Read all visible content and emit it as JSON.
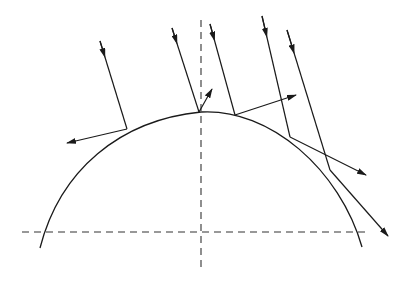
{
  "diagram": {
    "type": "ray-reflection-on-curved-surface",
    "colors": {
      "stroke": "#1a1a1a",
      "background": "#ffffff"
    },
    "axes": {
      "vertical": {
        "x": 201,
        "y1": 20,
        "y2": 268,
        "style": "dashed"
      },
      "horizontal": {
        "y": 232,
        "x1": 22,
        "x2": 370,
        "style": "dashed"
      }
    },
    "surface": {
      "shape": "arc",
      "path": "M40,248 C60,170 120,120 201,112 C270,108 340,170 362,247"
    },
    "rays": [
      {
        "id": 1,
        "incident": [
          [
            100,
            41
          ],
          [
            127,
            129
          ]
        ],
        "reflected": [
          [
            127,
            129
          ],
          [
            67,
            143
          ]
        ]
      },
      {
        "id": 2,
        "incident": [
          [
            172,
            28
          ],
          [
            199,
            112
          ]
        ],
        "reflected": [
          [
            199,
            112
          ],
          [
            212,
            89
          ]
        ]
      },
      {
        "id": 3,
        "incident": [
          [
            210,
            24
          ],
          [
            235,
            115
          ]
        ],
        "reflected": [
          [
            235,
            115
          ],
          [
            296,
            95
          ]
        ]
      },
      {
        "id": 4,
        "incident": [
          [
            262,
            16
          ],
          [
            290,
            137
          ]
        ],
        "reflected": [
          [
            290,
            137
          ],
          [
            366,
            175
          ]
        ]
      },
      {
        "id": 5,
        "incident": [
          [
            287,
            30
          ],
          [
            330,
            170
          ]
        ],
        "reflected": [
          [
            330,
            170
          ],
          [
            388,
            236
          ]
        ]
      }
    ]
  }
}
